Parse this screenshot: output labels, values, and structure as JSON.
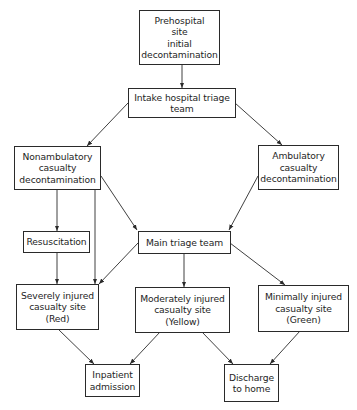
{
  "diagram": {
    "type": "flowchart",
    "colors": {
      "stroke": "#2a2a2a",
      "text": "#1e1e1e",
      "background": "#ffffff"
    },
    "nodes": {
      "prehospital": {
        "label": "Prehospital\nsite\ninitial\ndecontamination"
      },
      "intake": {
        "label": "Intake hospital triage\nteam"
      },
      "nonambulatory": {
        "label": "Nonambulatory\ncasualty\ndecontamination"
      },
      "ambulatory": {
        "label": "Ambulatory\ncasualty\ndecontamination"
      },
      "resuscitation": {
        "label": "Resuscitation"
      },
      "main_triage": {
        "label": "Main triage team"
      },
      "severely": {
        "label": "Severely injured\ncasualty site\n(Red)"
      },
      "moderately": {
        "label": "Moderately injured\ncasualty site\n(Yellow)"
      },
      "minimally": {
        "label": "Minimally injured\ncasualty site\n(Green)"
      },
      "inpatient": {
        "label": "Inpatient\nadmission"
      },
      "discharge": {
        "label": "Discharge\nto home"
      }
    },
    "edges": [
      {
        "from": "prehospital",
        "to": "intake"
      },
      {
        "from": "intake",
        "to": "nonambulatory"
      },
      {
        "from": "intake",
        "to": "ambulatory"
      },
      {
        "from": "nonambulatory",
        "to": "resuscitation"
      },
      {
        "from": "nonambulatory",
        "to": "severely"
      },
      {
        "from": "nonambulatory",
        "to": "main_triage"
      },
      {
        "from": "ambulatory",
        "to": "main_triage"
      },
      {
        "from": "resuscitation",
        "to": "severely"
      },
      {
        "from": "main_triage",
        "to": "severely"
      },
      {
        "from": "main_triage",
        "to": "moderately"
      },
      {
        "from": "main_triage",
        "to": "minimally"
      },
      {
        "from": "severely",
        "to": "inpatient"
      },
      {
        "from": "moderately",
        "to": "inpatient"
      },
      {
        "from": "moderately",
        "to": "discharge"
      },
      {
        "from": "minimally",
        "to": "discharge"
      }
    ]
  }
}
